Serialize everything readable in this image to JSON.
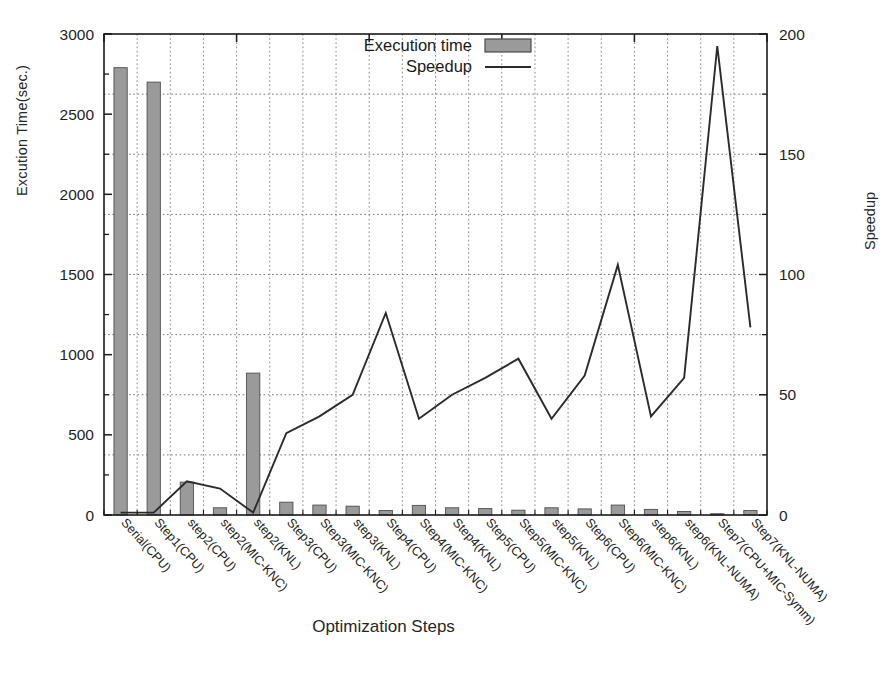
{
  "chart_data": {
    "type": "bar",
    "title": "",
    "xlabel": "Optimization Steps",
    "ylabel": "Excution Time(sec.)",
    "y2label": "Speedup",
    "ylim": [
      0,
      3000
    ],
    "y2lim": [
      0,
      200
    ],
    "yticks": [
      "0",
      "500",
      "1000",
      "1500",
      "2000",
      "2500",
      "3000"
    ],
    "ytick_values": [
      0,
      500,
      1000,
      1500,
      2000,
      2500,
      3000
    ],
    "y2ticks": [
      "0",
      "50",
      "100",
      "150",
      "200"
    ],
    "y2tick_values": [
      0,
      50,
      100,
      150,
      200
    ],
    "grid": true,
    "legend_position": "top-center",
    "categories": [
      "Serial(CPU)",
      "Step1(CPU)",
      "step2(CPU)",
      "step2(MIC-KNC)",
      "step2(KNL)",
      "Step3(CPU)",
      "Step3(MIC-KNC)",
      "step3(KNL)",
      "Step4(CPU)",
      "Step4(MIC-KNC)",
      "Step4(KNL)",
      "Step5(CPU)",
      "Step5(MIC-KNC)",
      "step5(KNL)",
      "Step6(CPU)",
      "Step6(MIC-KNC)",
      "step6(KNL)",
      "step6(KNL-NUMA)",
      "Step7(CPU+MIC-Symm)",
      "Step7(KNL-NUMA)"
    ],
    "series": [
      {
        "name": "Execution time",
        "axis": "left",
        "type": "bar",
        "color": "#9a9a9a",
        "values": [
          2790,
          2700,
          205,
          45,
          885,
          80,
          62,
          55,
          28,
          60,
          45,
          40,
          30,
          45,
          38,
          62,
          35,
          22,
          8,
          28
        ]
      },
      {
        "name": "Speedup",
        "axis": "right",
        "type": "line",
        "color": "#2b2b2b",
        "values": [
          1,
          1,
          14,
          11,
          1,
          34,
          41,
          50,
          84,
          40,
          50,
          57,
          65,
          40,
          58,
          104,
          41,
          57,
          195,
          78
        ]
      }
    ],
    "legend": [
      {
        "label": "Execution time",
        "marker": "filled-box",
        "color": "#9a9a9a"
      },
      {
        "label": "Speedup",
        "marker": "line",
        "color": "#2b2b2b"
      }
    ]
  },
  "figure": {
    "caption": ""
  }
}
